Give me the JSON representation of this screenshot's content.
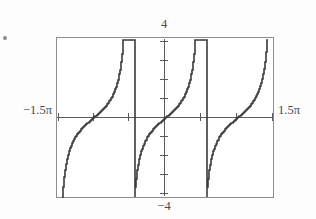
{
  "figure": {
    "kind": "graphing-calculator-plot",
    "marker": "bullet",
    "axis_color": "#5a5a5a",
    "frame_color": "#8d8d8d",
    "curve_color": "#3a3a3a",
    "background": "#ffffff"
  },
  "labels": {
    "top": "4",
    "bottom": "−4",
    "left": "−1.5π",
    "right": "1.5π"
  },
  "chart_data": {
    "type": "line",
    "title": "",
    "xlabel": "",
    "ylabel": "",
    "function": "tan(x)",
    "xlim": [
      -4.71238898038469,
      4.71238898038469
    ],
    "ylim": [
      -4,
      4
    ],
    "xlim_label_left": "−1.5π",
    "xlim_label_right": "1.5π",
    "ylim_label_top": "4",
    "ylim_label_bottom": "−4",
    "grid": false,
    "legend": null,
    "x_tick_values": [
      -4.71238898038469,
      -3.141592653589793,
      -1.570796326794897,
      0,
      1.570796326794897,
      3.141592653589793,
      4.71238898038469
    ],
    "y_tick_values": [
      -4,
      -3,
      -2,
      -1,
      0,
      1,
      2,
      3,
      4
    ],
    "asymptotes_x": [
      -3.926990816987241,
      -2.356194490192345,
      -0.785398163397448,
      0.785398163397448,
      2.356194490192345,
      3.926990816987241
    ],
    "branches": [
      {
        "name": "branch-1-upper-left",
        "x": [
          -4.71238898038469,
          -4.6,
          -4.5,
          -4.4,
          -4.3,
          -4.2,
          -4.1,
          -4.0
        ],
        "y": [
          4.0,
          3.45,
          3.05,
          2.7,
          2.38,
          2.08,
          1.8,
          1.52
        ]
      },
      {
        "name": "branch-2-lower-left-of-first-asymptote",
        "x": [
          -3.85,
          -3.7,
          -3.55,
          -3.4,
          -3.25,
          -3.141592653589793
        ],
        "y": [
          -4.0,
          -2.55,
          -1.85,
          -1.4,
          -1.05,
          -0.82
        ]
      },
      {
        "name": "branch-3-center-left",
        "x": [
          -3.141592653589793,
          -3.0,
          -2.85,
          -2.7,
          -2.55,
          -2.42
        ],
        "y": [
          -0.82,
          -0.58,
          -0.35,
          -0.15,
          0.05,
          0.28
        ]
      },
      {
        "name": "branch-4-center-right",
        "x": [
          -2.3,
          -2.1,
          -1.9,
          -1.75,
          -1.6,
          -1.45,
          -1.3,
          -1.15,
          -1.0,
          -0.85,
          -0.7,
          -0.55,
          -0.4,
          -0.25,
          -0.1,
          0
        ],
        "y": [
          4.0,
          2.62,
          1.8,
          1.4,
          1.1,
          0.85,
          0.62,
          0.42,
          0.22,
          0.05,
          -0.15,
          -0.35,
          -0.58,
          -0.82,
          -1.05,
          -1.25
        ]
      }
    ]
  }
}
